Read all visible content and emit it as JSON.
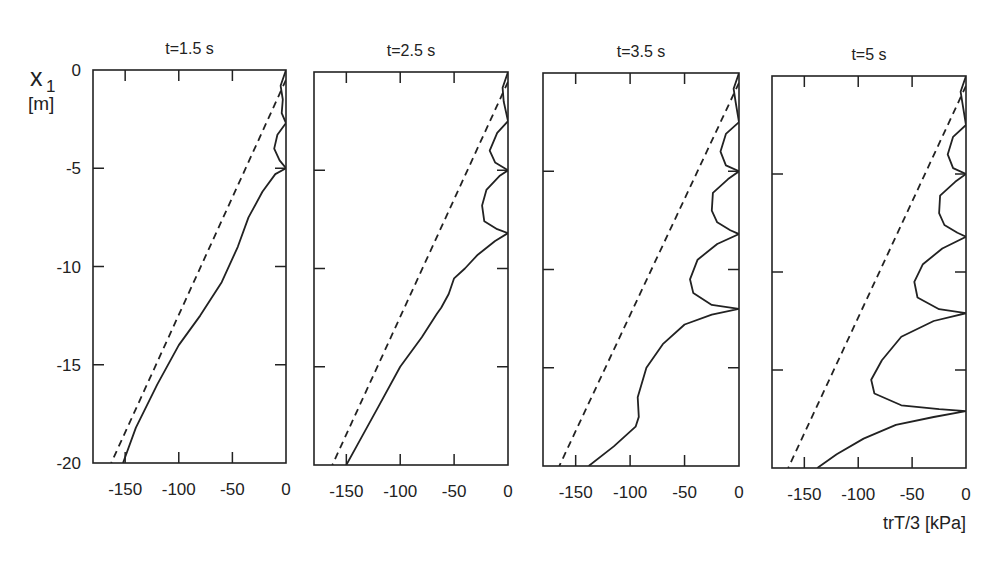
{
  "figure": {
    "y_axis_label_line1": "x",
    "y_axis_label_sub": "1",
    "y_axis_label_line2": "[m]",
    "x_axis_label": "trT/3  [kPa]",
    "line_color": "#222222",
    "background": "#ffffff"
  },
  "chart_data": [
    {
      "type": "line",
      "title": "t=1.5 s",
      "xlabel": "trT/3 [kPa]",
      "ylabel": "x1 [m]",
      "xlim": [
        -180,
        0
      ],
      "ylim": [
        -20,
        0
      ],
      "xticks": [
        -150,
        -100,
        -50,
        0
      ],
      "yticks": [
        0,
        -5,
        -10,
        -15,
        -20
      ],
      "grid": false,
      "series": [
        {
          "name": "initial (dashed)",
          "style": "dashed",
          "points": [
            [
              0,
              -0.5
            ],
            [
              -163,
              -20
            ]
          ]
        },
        {
          "name": "solution (solid)",
          "style": "solid",
          "points": [
            [
              0,
              0
            ],
            [
              -5,
              -0.8
            ],
            [
              -3,
              -1.5
            ],
            [
              -4,
              -2.2
            ],
            [
              0,
              -2.7
            ],
            [
              -8,
              -3.3
            ],
            [
              -11,
              -4.0
            ],
            [
              -6,
              -4.6
            ],
            [
              0,
              -5.0
            ],
            [
              -10,
              -5.3
            ],
            [
              -22,
              -6.2
            ],
            [
              -35,
              -7.5
            ],
            [
              -45,
              -9.0
            ],
            [
              -60,
              -10.8
            ],
            [
              -80,
              -12.5
            ],
            [
              -100,
              -14.0
            ],
            [
              -120,
              -16.0
            ],
            [
              -140,
              -18.2
            ],
            [
              -152,
              -20
            ]
          ]
        }
      ]
    },
    {
      "type": "line",
      "title": "t=2.5 s",
      "xlabel": "trT/3 [kPa]",
      "ylabel": "x1 [m]",
      "xlim": [
        -180,
        0
      ],
      "ylim": [
        -20,
        0
      ],
      "xticks": [
        -150,
        -100,
        -50,
        0
      ],
      "yticks": [
        0,
        -5,
        -10,
        -15,
        -20
      ],
      "grid": false,
      "series": [
        {
          "name": "initial (dashed)",
          "style": "dashed",
          "points": [
            [
              0,
              -0.5
            ],
            [
              -163,
              -20
            ]
          ]
        },
        {
          "name": "solution (solid)",
          "style": "solid",
          "points": [
            [
              0,
              0
            ],
            [
              -5,
              -0.8
            ],
            [
              -4,
              -1.5
            ],
            [
              0,
              -2.5
            ],
            [
              -10,
              -3.1
            ],
            [
              -17,
              -4.0
            ],
            [
              -12,
              -4.6
            ],
            [
              0,
              -5.0
            ],
            [
              -8,
              -5.3
            ],
            [
              -20,
              -6.0
            ],
            [
              -24,
              -6.8
            ],
            [
              -22,
              -7.6
            ],
            [
              -10,
              -8.0
            ],
            [
              0,
              -8.2
            ],
            [
              -12,
              -8.6
            ],
            [
              -28,
              -9.3
            ],
            [
              -40,
              -10.0
            ],
            [
              -50,
              -10.5
            ],
            [
              -55,
              -11.3
            ],
            [
              -62,
              -12.0
            ],
            [
              -66,
              -12.3
            ],
            [
              -80,
              -13.5
            ],
            [
              -100,
              -15.0
            ],
            [
              -120,
              -17.0
            ],
            [
              -140,
              -19.0
            ],
            [
              -150,
              -20
            ]
          ]
        }
      ]
    },
    {
      "type": "line",
      "title": "t=3.5 s",
      "xlabel": "trT/3 [kPa]",
      "ylabel": "x1 [m]",
      "xlim": [
        -180,
        0
      ],
      "ylim": [
        -20,
        0
      ],
      "xticks": [
        -150,
        -100,
        -50,
        0
      ],
      "yticks": [
        0,
        -5,
        -10,
        -15,
        -20
      ],
      "grid": false,
      "series": [
        {
          "name": "initial (dashed)",
          "style": "dashed",
          "points": [
            [
              0,
              -0.5
            ],
            [
              -165,
              -20
            ]
          ]
        },
        {
          "name": "solution (solid)",
          "style": "solid",
          "points": [
            [
              0,
              0
            ],
            [
              -5,
              -0.8
            ],
            [
              -3,
              -1.5
            ],
            [
              0,
              -2.5
            ],
            [
              -12,
              -3.1
            ],
            [
              -17,
              -4.0
            ],
            [
              -12,
              -4.7
            ],
            [
              0,
              -5.0
            ],
            [
              -10,
              -5.4
            ],
            [
              -24,
              -6.1
            ],
            [
              -25,
              -7.0
            ],
            [
              -20,
              -7.6
            ],
            [
              -8,
              -8.0
            ],
            [
              0,
              -8.2
            ],
            [
              -20,
              -8.7
            ],
            [
              -38,
              -9.5
            ],
            [
              -45,
              -10.5
            ],
            [
              -42,
              -11.2
            ],
            [
              -25,
              -11.8
            ],
            [
              0,
              -12.0
            ],
            [
              -25,
              -12.3
            ],
            [
              -50,
              -12.8
            ],
            [
              -70,
              -13.8
            ],
            [
              -85,
              -15.0
            ],
            [
              -93,
              -16.5
            ],
            [
              -92,
              -17.5
            ],
            [
              -95,
              -18.0
            ],
            [
              -115,
              -19.0
            ],
            [
              -138,
              -20
            ]
          ]
        }
      ]
    },
    {
      "type": "line",
      "title": "t=5 s",
      "xlabel": "trT/3 [kPa]",
      "ylabel": "x1 [m]",
      "xlim": [
        -180,
        0
      ],
      "ylim": [
        -20,
        0
      ],
      "xticks": [
        -150,
        -100,
        -50,
        0
      ],
      "yticks": [
        0,
        -5,
        -10,
        -15,
        -20
      ],
      "grid": false,
      "series": [
        {
          "name": "initial (dashed)",
          "style": "dashed",
          "points": [
            [
              0,
              -0.5
            ],
            [
              -165,
              -20
            ]
          ]
        },
        {
          "name": "solution (solid)",
          "style": "solid",
          "points": [
            [
              0,
              0
            ],
            [
              -5,
              -0.8
            ],
            [
              -3,
              -1.5
            ],
            [
              0,
              -2.5
            ],
            [
              -12,
              -3.1
            ],
            [
              -17,
              -4.0
            ],
            [
              -12,
              -4.7
            ],
            [
              0,
              -5.0
            ],
            [
              -10,
              -5.4
            ],
            [
              -24,
              -6.1
            ],
            [
              -25,
              -7.0
            ],
            [
              -20,
              -7.6
            ],
            [
              -8,
              -8.0
            ],
            [
              0,
              -8.2
            ],
            [
              -22,
              -8.8
            ],
            [
              -40,
              -9.6
            ],
            [
              -48,
              -10.5
            ],
            [
              -45,
              -11.3
            ],
            [
              -25,
              -11.9
            ],
            [
              0,
              -12.1
            ],
            [
              -30,
              -12.5
            ],
            [
              -60,
              -13.3
            ],
            [
              -78,
              -14.5
            ],
            [
              -88,
              -15.5
            ],
            [
              -85,
              -16.2
            ],
            [
              -60,
              -16.8
            ],
            [
              -25,
              -17.0
            ],
            [
              0,
              -17.1
            ],
            [
              -30,
              -17.4
            ],
            [
              -65,
              -17.8
            ],
            [
              -95,
              -18.5
            ],
            [
              -120,
              -19.3
            ],
            [
              -138,
              -20
            ]
          ]
        }
      ]
    }
  ]
}
